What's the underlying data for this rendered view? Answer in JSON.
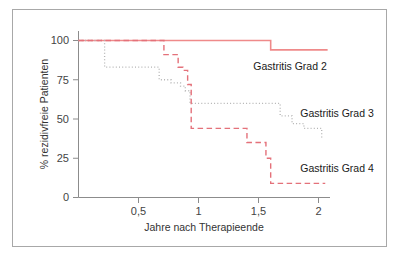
{
  "figure": {
    "border_color": "#a8a8a8",
    "background": "#ffffff"
  },
  "chart_data": {
    "type": "line",
    "title": "",
    "subtitle": "",
    "xlabel": "Jahre nach Therapieende",
    "ylabel": "% rezidivfreie Patienten",
    "xlim": [
      0,
      2.12
    ],
    "ylim": [
      0,
      104
    ],
    "grid": false,
    "legend_position": "inline-right",
    "xticks": [
      0.5,
      1,
      1.5,
      2
    ],
    "xtick_labels": [
      "0,5",
      "1",
      "1,5",
      "2"
    ],
    "yticks": [
      0,
      25,
      50,
      75,
      100
    ],
    "ytick_labels": [
      "0",
      "25",
      "50",
      "75",
      "100"
    ],
    "step_style": "post",
    "series": [
      {
        "name": "Gastritis Grad 2",
        "label": "Gastritis Grad 2",
        "color": "#ef8a8a",
        "dash": "solid",
        "x": [
          0.0,
          1.62,
          2.1
        ],
        "y": [
          100,
          94,
          94
        ]
      },
      {
        "name": "Gastritis Grad 3",
        "label": "Gastritis Grad 3",
        "color": "#b3b3b3",
        "dash": "dotted",
        "x": [
          0.0,
          0.2,
          0.22,
          0.56,
          0.68,
          0.7,
          0.78,
          0.86,
          0.9,
          0.94,
          1.0,
          1.38,
          1.62,
          1.7,
          1.8,
          1.9,
          2.05
        ],
        "y": [
          100,
          100,
          83,
          83,
          75,
          75,
          73,
          71,
          68,
          60,
          60,
          60,
          60,
          52,
          47,
          44,
          38
        ]
      },
      {
        "name": "Gastritis Grad 4",
        "label": "Gastritis Grad 4",
        "color": "#e4717a",
        "dash": "dashed",
        "x": [
          0.0,
          0.68,
          0.72,
          0.78,
          0.84,
          0.88,
          0.92,
          0.95,
          1.38,
          1.42,
          1.55,
          1.58,
          1.62,
          2.08
        ],
        "y": [
          100,
          100,
          91,
          91,
          83,
          81,
          72,
          44,
          44,
          35,
          35,
          25,
          9,
          9
        ]
      }
    ]
  },
  "legend": {
    "items": [
      {
        "label": "Gastritis Grad 2"
      },
      {
        "label": "Gastritis Grad 3"
      },
      {
        "label": "Gastritis Grad 4"
      }
    ]
  }
}
